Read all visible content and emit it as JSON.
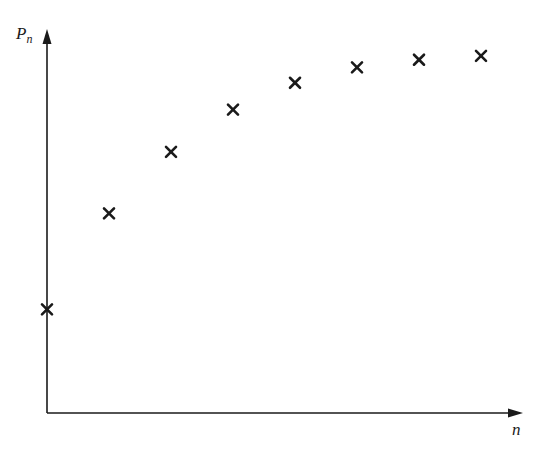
{
  "chart_data": {
    "type": "scatter",
    "title": "",
    "xlabel": "n",
    "ylabel": "P_n",
    "ylabel_main": "P",
    "ylabel_sub": "n",
    "marker": "x",
    "grid": false,
    "legend": null,
    "axis_ticks": "none",
    "x": [
      0,
      1,
      2,
      3,
      4,
      5,
      6,
      7
    ],
    "y_relative": [
      0.27,
      0.52,
      0.68,
      0.79,
      0.86,
      0.9,
      0.92,
      0.93
    ],
    "note": "Qualitative plot of P_n increasing and levelling off (concave, approaching an asymptote); no numeric tick labels shown, y values are relative to axis height"
  },
  "colors": {
    "axis": "#1a1a1a",
    "marker": "#1a1a1a",
    "background": "#ffffff"
  }
}
